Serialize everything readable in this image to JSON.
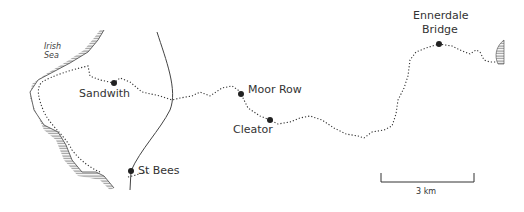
{
  "map": {
    "sea_label": [
      "Irish",
      "Sea"
    ],
    "places": [
      {
        "name": "Sandwith",
        "x": 114,
        "y": 83
      },
      {
        "name": "St Bees",
        "x": 131,
        "y": 171
      },
      {
        "name": "Moor Row",
        "x": 241,
        "y": 94
      },
      {
        "name": "Cleator",
        "x": 270,
        "y": 120
      },
      {
        "name": "Ennerdale Bridge",
        "x": 439,
        "y": 44
      }
    ],
    "labels": {
      "sandwith": "Sandwith",
      "st_bees": "St Bees",
      "moor_row": "Moor Row",
      "cleator": "Cleator",
      "ennerdale_1": "Ennerdale",
      "ennerdale_2": "Bridge"
    },
    "scale_bar": {
      "label": "3 km"
    },
    "colors": {
      "ink": "#333333",
      "background": "#ffffff"
    }
  }
}
